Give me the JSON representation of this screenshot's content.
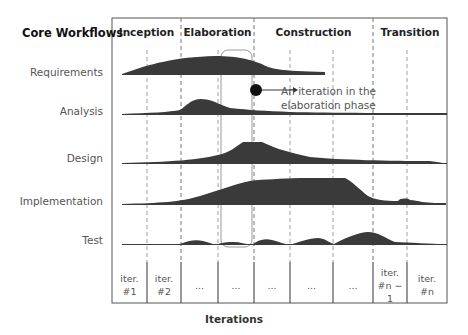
{
  "diagram": {
    "row_header": "Core Workflows",
    "phases": [
      {
        "label": "Inception",
        "x_start": 112,
        "x_end": 181
      },
      {
        "label": "Elaboration",
        "x_start": 181,
        "x_end": 254
      },
      {
        "label": "Construction",
        "x_start": 254,
        "x_end": 373
      },
      {
        "label": "Transition",
        "x_start": 373,
        "x_end": 447
      }
    ],
    "workflows": [
      {
        "label": "Requirements",
        "baseline_y": 74
      },
      {
        "label": "Analysis",
        "baseline_y": 114
      },
      {
        "label": "Design",
        "baseline_y": 163
      },
      {
        "label": "Implementation",
        "baseline_y": 204
      },
      {
        "label": "Test",
        "baseline_y": 244
      }
    ],
    "iterations": [
      {
        "line1": "iter.",
        "line2": "#1"
      },
      {
        "line1": "iter.",
        "line2": "#2"
      },
      {
        "line1": "...",
        "line2": ""
      },
      {
        "line1": "...",
        "line2": ""
      },
      {
        "line1": "...",
        "line2": ""
      },
      {
        "line1": "...",
        "line2": ""
      },
      {
        "line1": "...",
        "line2": ""
      },
      {
        "line1": "iter.",
        "line2": "#n − 1"
      },
      {
        "line1": "iter.",
        "line2": "#n"
      }
    ],
    "annotation": {
      "line1": "An iteration in the",
      "line2": "elaboration phase"
    },
    "x_axis_label": "Iterations",
    "colors": {
      "fill": "#3a3a3a",
      "frame": "#555555",
      "highlight": "#999999"
    }
  }
}
